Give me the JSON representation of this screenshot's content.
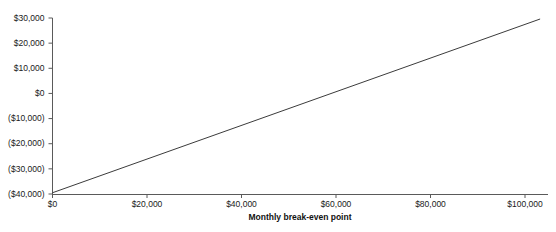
{
  "chart_data": {
    "type": "line",
    "title": "",
    "subtitle": "",
    "xlabel": "Monthly break-even point",
    "ylabel": "",
    "grid": false,
    "legend": "none",
    "xlim": [
      0,
      111000
    ],
    "ylim": [
      -40000,
      30000
    ],
    "x_ticks": [
      0,
      20000,
      40000,
      60000,
      80000,
      100000
    ],
    "x_tick_labels": [
      "$0",
      "$20,000",
      "$40,000",
      "$60,000",
      "$80,000",
      "$100,000"
    ],
    "y_ticks": [
      30000,
      20000,
      10000,
      0,
      -10000,
      -20000,
      -30000,
      -40000
    ],
    "y_tick_labels": [
      "$30,000",
      "$20,000",
      "$10,000",
      "$0",
      "($10,000)",
      "($20,000)",
      "($30,000)",
      "($40,000)"
    ],
    "series": [
      {
        "name": "Profit",
        "color": "#3b3b3b",
        "x": [
          0,
          103200
        ],
        "values": [
          -39500,
          29600
        ]
      }
    ],
    "annotations": {
      "break_even_x": 58800,
      "break_even_label": ""
    }
  },
  "style": {
    "axis_color": "#5a5a5a",
    "line_color": "#3b3b3b",
    "text_color": "#1a1a1a",
    "background": "#ffffff"
  }
}
